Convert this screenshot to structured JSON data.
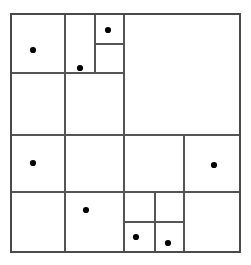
{
  "figure": {
    "title": "",
    "background_color": "#ffffff",
    "line_color": "#555555",
    "outer_line_color": "#4a4a4a",
    "point_color": "#000000",
    "line_width": 1.1,
    "outer_line_width": 1.4,
    "point_radius": 3.1,
    "bounds": {
      "x0": 11,
      "y0": 14,
      "x1": 240,
      "y1": 252
    }
  },
  "chart_data": {
    "type": "diagram",
    "subtype": "rectangular-partition-with-points",
    "title": "",
    "xlabel": "",
    "ylabel": "",
    "grid": false,
    "legend": null,
    "xlim": [
      11,
      240
    ],
    "ylim": [
      14,
      252
    ],
    "outer_rect": {
      "x": 11,
      "y": 14,
      "w": 229,
      "h": 238
    },
    "segments": [
      {
        "id": "v-65-top",
        "orientation": "vertical",
        "x": 65,
        "y1": 14,
        "y2": 73
      },
      {
        "id": "v-95-top",
        "orientation": "vertical",
        "x": 95,
        "y1": 14,
        "y2": 73
      },
      {
        "id": "v-124-full",
        "orientation": "vertical",
        "x": 124,
        "y1": 14,
        "y2": 252
      },
      {
        "id": "v-65-mid",
        "orientation": "vertical",
        "x": 65,
        "y1": 73,
        "y2": 252
      },
      {
        "id": "v-184-low",
        "orientation": "vertical",
        "x": 184,
        "y1": 135,
        "y2": 252
      },
      {
        "id": "v-155-bot",
        "orientation": "vertical",
        "x": 155,
        "y1": 192,
        "y2": 252
      },
      {
        "id": "h-44-top",
        "orientation": "horizontal",
        "y": 44,
        "x1": 95,
        "x2": 124
      },
      {
        "id": "h-73-top",
        "orientation": "horizontal",
        "y": 73,
        "x1": 11,
        "x2": 124
      },
      {
        "id": "h-135-mid",
        "orientation": "horizontal",
        "y": 135,
        "x1": 11,
        "x2": 240
      },
      {
        "id": "h-192-low",
        "orientation": "horizontal",
        "y": 192,
        "x1": 11,
        "x2": 240
      },
      {
        "id": "h-222-bot",
        "orientation": "horizontal",
        "y": 222,
        "x1": 124,
        "x2": 184
      }
    ],
    "points": [
      {
        "id": "p1",
        "x": 33,
        "y": 50
      },
      {
        "id": "p2",
        "x": 108,
        "y": 30
      },
      {
        "id": "p3",
        "x": 80,
        "y": 68
      },
      {
        "id": "p4",
        "x": 33,
        "y": 163
      },
      {
        "id": "p5",
        "x": 214,
        "y": 165
      },
      {
        "id": "p6",
        "x": 86,
        "y": 210
      },
      {
        "id": "p7",
        "x": 136,
        "y": 237
      },
      {
        "id": "p8",
        "x": 168,
        "y": 243
      }
    ],
    "point_count": 8,
    "cells": [
      {
        "id": "c1",
        "x": 11,
        "y": 14,
        "w": 54,
        "h": 59,
        "point": "p1"
      },
      {
        "id": "c2",
        "x": 65,
        "y": 14,
        "w": 30,
        "h": 30,
        "point": null
      },
      {
        "id": "c3",
        "x": 95,
        "y": 14,
        "w": 29,
        "h": 30,
        "point": "p2"
      },
      {
        "id": "c4",
        "x": 65,
        "y": 44,
        "w": 30,
        "h": 29,
        "point": "p3"
      },
      {
        "id": "c5",
        "x": 95,
        "y": 44,
        "w": 29,
        "h": 29,
        "point": null
      },
      {
        "id": "c6",
        "x": 124,
        "y": 14,
        "w": 116,
        "h": 121,
        "point": null
      },
      {
        "id": "c7",
        "x": 11,
        "y": 73,
        "w": 54,
        "h": 62,
        "point": null
      },
      {
        "id": "c8",
        "x": 65,
        "y": 73,
        "w": 59,
        "h": 62,
        "point": null
      },
      {
        "id": "c9",
        "x": 11,
        "y": 135,
        "w": 54,
        "h": 57,
        "point": "p4"
      },
      {
        "id": "c10",
        "x": 65,
        "y": 135,
        "w": 59,
        "h": 57,
        "point": null
      },
      {
        "id": "c11",
        "x": 124,
        "y": 135,
        "w": 60,
        "h": 57,
        "point": null
      },
      {
        "id": "c12",
        "x": 184,
        "y": 135,
        "w": 56,
        "h": 57,
        "point": "p5"
      },
      {
        "id": "c13",
        "x": 11,
        "y": 192,
        "w": 54,
        "h": 60,
        "point": null
      },
      {
        "id": "c14",
        "x": 65,
        "y": 192,
        "w": 59,
        "h": 60,
        "point": "p6"
      },
      {
        "id": "c15",
        "x": 124,
        "y": 192,
        "w": 31,
        "h": 30,
        "point": null
      },
      {
        "id": "c16",
        "x": 155,
        "y": 192,
        "w": 29,
        "h": 30,
        "point": null
      },
      {
        "id": "c17",
        "x": 124,
        "y": 222,
        "w": 31,
        "h": 30,
        "point": "p7"
      },
      {
        "id": "c18",
        "x": 155,
        "y": 222,
        "w": 29,
        "h": 30,
        "point": "p8"
      },
      {
        "id": "c19",
        "x": 184,
        "y": 192,
        "w": 56,
        "h": 60,
        "point": null
      }
    ]
  }
}
